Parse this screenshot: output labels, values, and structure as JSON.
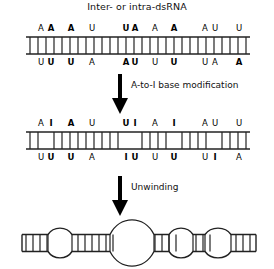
{
  "figure": {
    "title": "Inter- or intra-dsRNA",
    "arrows": [
      {
        "label": "A-to-I base modification"
      },
      {
        "label": "Unwinding"
      }
    ]
  },
  "panels": [
    {
      "name": "unedited-duplex",
      "top_bases": [
        {
          "letter": "A",
          "x": 41,
          "bold": false
        },
        {
          "letter": "A",
          "x": 51,
          "bold": true
        },
        {
          "letter": "A",
          "x": 71,
          "bold": true
        },
        {
          "letter": "U",
          "x": 92,
          "bold": false
        },
        {
          "letter": "U",
          "x": 126,
          "bold": true
        },
        {
          "letter": "A",
          "x": 135,
          "bold": true
        },
        {
          "letter": "A",
          "x": 155,
          "bold": false
        },
        {
          "letter": "A",
          "x": 174,
          "bold": true
        },
        {
          "letter": "A",
          "x": 205,
          "bold": false
        },
        {
          "letter": "U",
          "x": 215,
          "bold": false
        },
        {
          "letter": "U",
          "x": 239,
          "bold": false
        }
      ],
      "bottom_bases": [
        {
          "letter": "U",
          "x": 41,
          "bold": false
        },
        {
          "letter": "U",
          "x": 51,
          "bold": true
        },
        {
          "letter": "U",
          "x": 71,
          "bold": true
        },
        {
          "letter": "A",
          "x": 92,
          "bold": false
        },
        {
          "letter": "A",
          "x": 126,
          "bold": true
        },
        {
          "letter": "U",
          "x": 135,
          "bold": true
        },
        {
          "letter": "U",
          "x": 155,
          "bold": false
        },
        {
          "letter": "U",
          "x": 174,
          "bold": true
        },
        {
          "letter": "U",
          "x": 205,
          "bold": false
        },
        {
          "letter": "A",
          "x": 215,
          "bold": false
        },
        {
          "letter": "A",
          "x": 239,
          "bold": true
        }
      ],
      "rungs": [
        30,
        38,
        46,
        54,
        62,
        70,
        78,
        86,
        94,
        102,
        110,
        118,
        126,
        134,
        142,
        150,
        158,
        166,
        174,
        182,
        190,
        198,
        206,
        214,
        222,
        230,
        238,
        246
      ],
      "rail_left": 26,
      "rail_right": 250
    },
    {
      "name": "edited-duplex",
      "top_bases": [
        {
          "letter": "A",
          "x": 41,
          "bold": false
        },
        {
          "letter": "I",
          "x": 51,
          "bold": true
        },
        {
          "letter": "A",
          "x": 71,
          "bold": true
        },
        {
          "letter": "U",
          "x": 92,
          "bold": false
        },
        {
          "letter": "U",
          "x": 126,
          "bold": true
        },
        {
          "letter": "I",
          "x": 135,
          "bold": true
        },
        {
          "letter": "A",
          "x": 155,
          "bold": false
        },
        {
          "letter": "I",
          "x": 174,
          "bold": true
        },
        {
          "letter": "A",
          "x": 205,
          "bold": false
        },
        {
          "letter": "U",
          "x": 215,
          "bold": false
        },
        {
          "letter": "U",
          "x": 239,
          "bold": false
        }
      ],
      "bottom_bases": [
        {
          "letter": "U",
          "x": 41,
          "bold": false
        },
        {
          "letter": "U",
          "x": 51,
          "bold": true
        },
        {
          "letter": "U",
          "x": 71,
          "bold": true
        },
        {
          "letter": "A",
          "x": 92,
          "bold": false
        },
        {
          "letter": "I",
          "x": 126,
          "bold": true
        },
        {
          "letter": "U",
          "x": 135,
          "bold": true
        },
        {
          "letter": "U",
          "x": 155,
          "bold": false
        },
        {
          "letter": "U",
          "x": 174,
          "bold": true
        },
        {
          "letter": "U",
          "x": 205,
          "bold": false
        },
        {
          "letter": "I",
          "x": 215,
          "bold": true
        },
        {
          "letter": "A",
          "x": 239,
          "bold": false
        }
      ],
      "rungs": [
        30,
        38,
        54,
        62,
        70,
        78,
        86,
        94,
        102,
        110,
        118,
        142,
        150,
        158,
        166,
        182,
        190,
        198,
        206,
        222,
        230,
        238,
        246
      ],
      "rail_left": 26,
      "rail_right": 250
    },
    {
      "name": "unwound-duplex",
      "rail_left": 22,
      "rail_right": 256,
      "bubbles": [
        {
          "cx": 60,
          "rx": 12,
          "ry": 17
        },
        {
          "cx": 132,
          "rx": 22,
          "ry": 28
        },
        {
          "cx": 181,
          "rx": 12,
          "ry": 17
        },
        {
          "cx": 218,
          "rx": 13,
          "ry": 17
        }
      ],
      "rungs": [
        26,
        33,
        40,
        47,
        78,
        85,
        92,
        99,
        106,
        113,
        155,
        162,
        169,
        176,
        196,
        203,
        210,
        236,
        243,
        250
      ]
    }
  ],
  "colors": {
    "stroke": "#222222",
    "text": "#000000",
    "background": "#ffffff"
  }
}
